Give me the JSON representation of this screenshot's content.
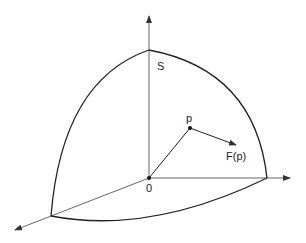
{
  "diagram": {
    "labels": {
      "sphere": "S",
      "origin": "0",
      "point": "p",
      "field": "F(p)"
    },
    "colors": {
      "stroke": "#222222",
      "axis": "#444444",
      "background": "#ffffff"
    }
  }
}
